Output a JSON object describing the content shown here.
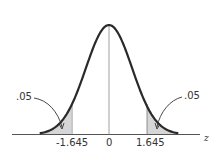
{
  "chart_data": {
    "type": "area",
    "title": "",
    "xlabel": "z",
    "ylabel": "",
    "x_ticks": [
      "-1.645",
      "0",
      "1.645"
    ],
    "xlim": [
      -3.0,
      3.0
    ],
    "curve": "standard normal density",
    "shaded_regions": [
      {
        "from": -3.0,
        "to": -1.645,
        "area_label": ".05",
        "side": "left"
      },
      {
        "from": 1.645,
        "to": 3.0,
        "area_label": ".05",
        "side": "right"
      }
    ],
    "annotations": [
      {
        "text": ".05",
        "target": "left tail"
      },
      {
        "text": ".05",
        "target": "right tail"
      }
    ],
    "center_line_at": 0,
    "grid": false,
    "legend": null
  },
  "labels": {
    "left_area": ".05",
    "right_area": ".05",
    "tick_left": "-1.645",
    "tick_center": "0",
    "tick_right": "1.645",
    "axis": "z"
  },
  "colors": {
    "curve": "#2a2a2a",
    "shade": "#d6d6d6",
    "axis": "#555555"
  }
}
